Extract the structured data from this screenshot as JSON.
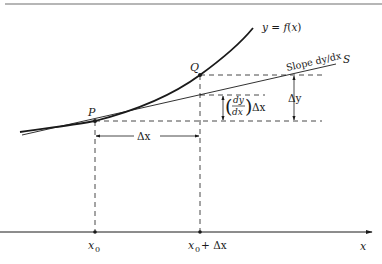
{
  "figure": {
    "colors": {
      "ink": "#1a1a1a",
      "rule": "#6e6e6e",
      "background": "#ffffff"
    },
    "labels": {
      "curve": "y = f(x)",
      "tangent_slope": "Slope dy/dx",
      "tangent_name": "S",
      "point_p": "P",
      "point_q": "Q",
      "delta_y": "Δy",
      "tangent_increment_num": "dy",
      "tangent_increment_den": "dx",
      "tangent_increment_suffix": "Δx",
      "delta_x": "Δx",
      "axis_x": "x",
      "tick_x0": "x",
      "tick_x0_sub": "0",
      "tick_x0_dx": "x",
      "tick_x0_dx_sub": "0",
      "tick_x0_dx_suffix": "+ Δx"
    }
  }
}
